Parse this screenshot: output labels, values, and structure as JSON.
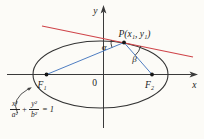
{
  "figure": {
    "colors": {
      "axes": "#3a3a3a",
      "curve": "#333333",
      "tangent_line": "#cf4449",
      "focal_lines": "#4f7ec2",
      "dot": "#161616",
      "annotation_arrow": "#3f3f3f",
      "text": "#1b1b1b",
      "background": "#fcfbf7"
    },
    "labels": {
      "y_axis": "y",
      "x_axis": "x",
      "origin": "0",
      "point_p": "P(x₁, y₁)",
      "focus_left": "F₁",
      "focus_right": "F₂",
      "angle_alpha": "α",
      "angle_beta": "β"
    },
    "equation": {
      "numerator_1": "x²",
      "denominator_1": "a²",
      "operator": "+",
      "numerator_2": "y²",
      "denominator_2": "b²",
      "equals": "= 1"
    }
  }
}
